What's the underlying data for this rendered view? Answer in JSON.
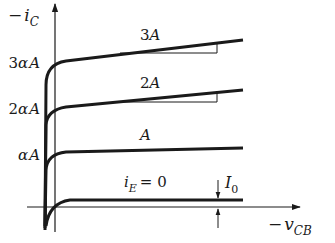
{
  "diagram": {
    "axes": {
      "y_label_prefix": "−",
      "y_label_var": "i",
      "y_label_sub": "C",
      "x_label_prefix": "−",
      "x_label_var": "v",
      "x_label_sub": "CB"
    },
    "y_ticks": [
      {
        "coef": "3",
        "alpha": "α",
        "var": "A"
      },
      {
        "coef": "2",
        "alpha": "α",
        "var": "A"
      },
      {
        "coef": "",
        "alpha": "α",
        "var": "A"
      }
    ],
    "curves": [
      {
        "label_coef": "3",
        "label_var": "A"
      },
      {
        "label_coef": "2",
        "label_var": "A"
      },
      {
        "label_coef": "",
        "label_var": "A"
      },
      {
        "label_var": "i",
        "label_sub": "E",
        "label_eq": "= 0"
      }
    ],
    "annotation": {
      "var": "I",
      "sub": "0"
    },
    "colors": {
      "ink": "#1a1a1a",
      "background": "#ffffff"
    }
  }
}
